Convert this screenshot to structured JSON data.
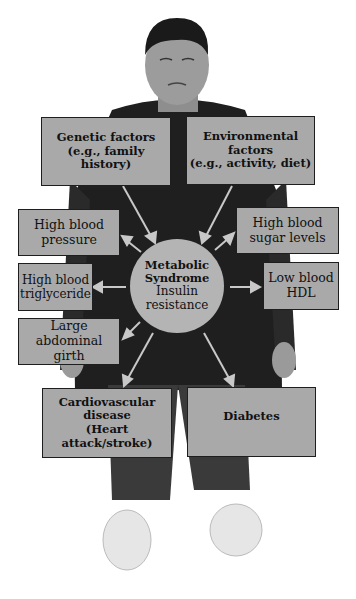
{
  "diagram": {
    "center": {
      "title_line1": "Metabolic",
      "title_line2": "Syndrome",
      "subtitle_line1": "Insulin",
      "subtitle_line2": "resistance"
    },
    "causes": [
      {
        "line1": "Genetic factors",
        "line2": "(e.g., family history)",
        "line3": ""
      },
      {
        "line1": "Environmental",
        "line2": "factors",
        "line3": "(e.g., activity, diet)"
      }
    ],
    "components": [
      {
        "line1": "High blood",
        "line2": "pressure"
      },
      {
        "line1": "High blood",
        "line2": "sugar levels"
      },
      {
        "line1": "High blood",
        "line2": "triglyceride"
      },
      {
        "line1": "Low blood",
        "line2": "HDL"
      },
      {
        "line1": "Large abdominal",
        "line2": "girth"
      }
    ],
    "outcomes": [
      {
        "line1": "Cardiovascular",
        "line2": "disease",
        "line3": "(Heart attack/stroke)"
      },
      {
        "line1": "Diabetes",
        "line2": "",
        "line3": ""
      }
    ],
    "colors": {
      "box_fill": "#a9a9a9",
      "circle_fill": "#b4b4b4",
      "arrow": "#c8c8c8",
      "clothing": "#1f1f1f"
    }
  }
}
